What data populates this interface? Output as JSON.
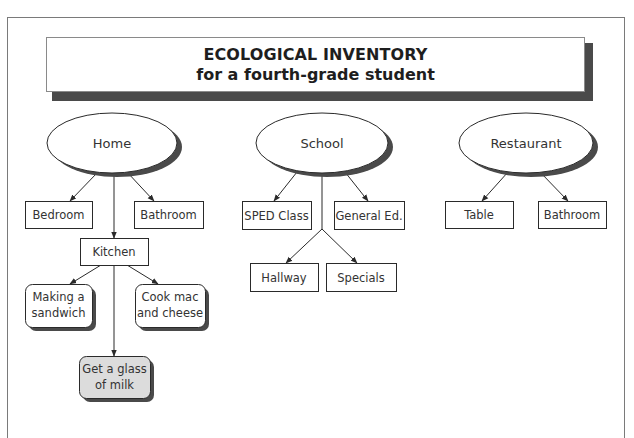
{
  "title": {
    "line1": "ECOLOGICAL INVENTORY",
    "line2": "for a fourth-grade student"
  },
  "colors": {
    "stroke": "#2a2a2a",
    "shadow": "#4a4a4a",
    "highlight_fill": "#dcdcdc",
    "node_fill": "#ffffff"
  },
  "environments": [
    {
      "id": "home",
      "label": "Home",
      "cx": 112,
      "cy": 143,
      "rx": 65,
      "ry": 30,
      "children": [
        {
          "id": "home-bedroom",
          "label": "Bedroom",
          "x": 25,
          "y": 201,
          "w": 67,
          "h": 27
        },
        {
          "id": "home-bathroom",
          "label": "Bathroom",
          "x": 134,
          "y": 201,
          "w": 69,
          "h": 27
        },
        {
          "id": "home-kitchen",
          "label": "Kitchen",
          "x": 80,
          "y": 238,
          "w": 68,
          "h": 27
        }
      ]
    },
    {
      "id": "school",
      "label": "School",
      "cx": 322,
      "cy": 143,
      "rx": 66,
      "ry": 30,
      "children": [
        {
          "id": "school-sped",
          "label": "SPED Class",
          "x": 242,
          "y": 201,
          "w": 69,
          "h": 28
        },
        {
          "id": "school-gened",
          "label": "General Ed.",
          "x": 334,
          "y": 201,
          "w": 70,
          "h": 28
        },
        {
          "id": "school-hallway",
          "label": "Hallway",
          "x": 250,
          "y": 263,
          "w": 68,
          "h": 28
        },
        {
          "id": "school-specials",
          "label": "Specials",
          "x": 326,
          "y": 263,
          "w": 70,
          "h": 28
        }
      ]
    },
    {
      "id": "restaurant",
      "label": "Restaurant",
      "cx": 526,
      "cy": 143,
      "rx": 67,
      "ry": 30,
      "children": [
        {
          "id": "rest-table",
          "label": "Table",
          "x": 445,
          "y": 201,
          "w": 68,
          "h": 27
        },
        {
          "id": "rest-bathroom",
          "label": "Bathroom",
          "x": 538,
          "y": 201,
          "w": 68,
          "h": 27
        }
      ]
    }
  ],
  "activities": [
    {
      "id": "act-sandwich",
      "lines": [
        "Making a",
        "sandwich"
      ],
      "x": 25,
      "y": 284,
      "w": 67,
      "h": 43,
      "highlight": false
    },
    {
      "id": "act-macncheese",
      "lines": [
        "Cook mac",
        "and cheese"
      ],
      "x": 135,
      "y": 284,
      "w": 70,
      "h": 43,
      "highlight": false
    },
    {
      "id": "act-milk",
      "lines": [
        "Get a glass",
        "of milk"
      ],
      "x": 79,
      "y": 356,
      "w": 71,
      "h": 42,
      "highlight": true
    }
  ],
  "arrows": [
    {
      "from": [
        97,
        173
      ],
      "to": [
        70,
        201
      ]
    },
    {
      "from": [
        127,
        172
      ],
      "to": [
        154,
        201
      ]
    },
    {
      "from": [
        114,
        173
      ],
      "to": [
        114,
        238
      ]
    },
    {
      "from": [
        297,
        172
      ],
      "to": [
        274,
        201
      ]
    },
    {
      "from": [
        345,
        172
      ],
      "to": [
        368,
        201
      ]
    },
    {
      "from": [
        322,
        173
      ],
      "to": [
        322,
        229
      ],
      "head": false
    },
    {
      "from": [
        322,
        229
      ],
      "to": [
        286,
        263
      ]
    },
    {
      "from": [
        322,
        229
      ],
      "to": [
        357,
        263
      ]
    },
    {
      "from": [
        508,
        172
      ],
      "to": [
        482,
        201
      ]
    },
    {
      "from": [
        540,
        172
      ],
      "to": [
        568,
        201
      ]
    },
    {
      "from": [
        101,
        265
      ],
      "to": [
        70,
        284
      ]
    },
    {
      "from": [
        127,
        265
      ],
      "to": [
        158,
        284
      ]
    },
    {
      "from": [
        114,
        265
      ],
      "to": [
        114,
        356
      ]
    }
  ]
}
